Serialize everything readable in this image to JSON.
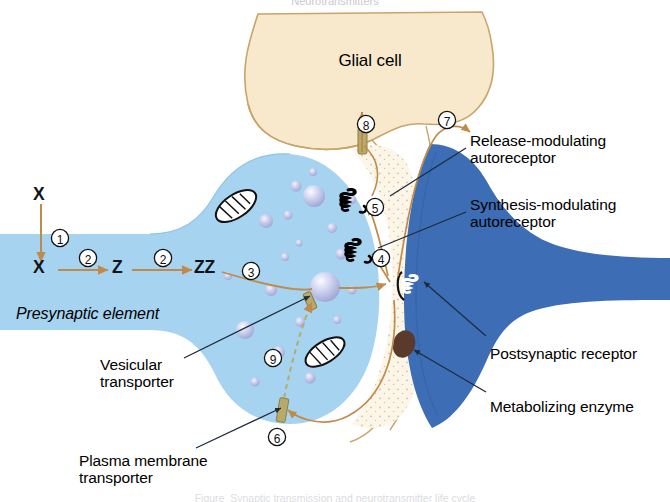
{
  "figure": {
    "title_top_cut": "Neurotransmitters",
    "caption_bottom_cut": "Figure  Synaptic transmission and neurotransmitter life cycle",
    "width": 670,
    "height": 502
  },
  "cells": {
    "glial": {
      "label": "Glial cell",
      "fill": "#F8E9CD",
      "stroke": "#C9A46B"
    },
    "presynaptic": {
      "label": "Presynaptic element",
      "fill": "#A6D3EF",
      "stroke": "#7FBBE0"
    },
    "postsynaptic": {
      "fill": "#3C6DB5",
      "stroke": "#2E5794"
    },
    "cleft": {
      "fill": "#FDF6E6",
      "stroke": "#C9924C"
    }
  },
  "molecules": {
    "precursor_outside": "X",
    "precursor_inside": "X",
    "intermediate": "Z",
    "transmitter": "ZZ"
  },
  "steps": [
    {
      "id": "1",
      "glyph": "①",
      "meaning": "precursor-uptake"
    },
    {
      "id": "2a",
      "glyph": "②",
      "meaning": "synthesis-step-1"
    },
    {
      "id": "2b",
      "glyph": "②",
      "meaning": "synthesis-step-2"
    },
    {
      "id": "3",
      "glyph": "③",
      "meaning": "vesicular-storage"
    },
    {
      "id": "4",
      "glyph": "④",
      "meaning": "synthesis-modulating-autoreceptor-feedback"
    },
    {
      "id": "5",
      "glyph": "⑤",
      "meaning": "release-modulating-autoreceptor-feedback"
    },
    {
      "id": "6",
      "glyph": "⑥",
      "meaning": "plasma-membrane-reuptake"
    },
    {
      "id": "7",
      "glyph": "⑦",
      "meaning": "postsynaptic-receptor-binding"
    },
    {
      "id": "8",
      "glyph": "⑧",
      "meaning": "glial-uptake"
    },
    {
      "id": "9",
      "glyph": "⑨",
      "meaning": "vesicular-transport"
    }
  ],
  "annotations": {
    "release_modulating": {
      "line1": "Release-modulating",
      "line2": "autoreceptor"
    },
    "synthesis_modulating": {
      "line1": "Synthesis-modulating",
      "line2": "autoreceptor"
    },
    "postsynaptic_receptor": {
      "line1": "Postsynaptic receptor"
    },
    "metabolizing_enzyme": {
      "line1": "Metabolizing enzyme"
    },
    "vesicular_transporter": {
      "line1": "Vesicular",
      "line2": "transporter"
    },
    "plasma_membrane_transporter": {
      "line1": "Plasma membrane",
      "line2": "transporter"
    }
  },
  "colors": {
    "arrow_orange": "#C08B4A",
    "leader_line": "#1F2C3C",
    "vesicle_fill": "#B9BEE4",
    "vesicle_highlight": "#EDEFFA",
    "transporter_fill": "#B9A96B",
    "enzyme_fill": "#5A3A2A",
    "receptor_dark": "#000000",
    "receptor_light": "#FFFFFF"
  }
}
